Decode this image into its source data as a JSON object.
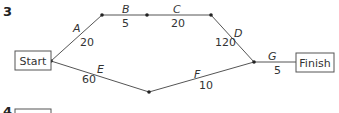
{
  "question_number": "3",
  "next_question_number": "4",
  "nodes": {
    "start": "Start",
    "finish": "Finish"
  },
  "edges": [
    {
      "label": "A",
      "weight": "20"
    },
    {
      "label": "B",
      "weight": "5"
    },
    {
      "label": "C",
      "weight": "20"
    },
    {
      "label": "D",
      "weight": "120"
    },
    {
      "label": "E",
      "weight": "60"
    },
    {
      "label": "F",
      "weight": "10"
    },
    {
      "label": "G",
      "weight": "5"
    }
  ],
  "colors": {
    "line": "#555555",
    "node": "#222222",
    "text": "#333333"
  }
}
